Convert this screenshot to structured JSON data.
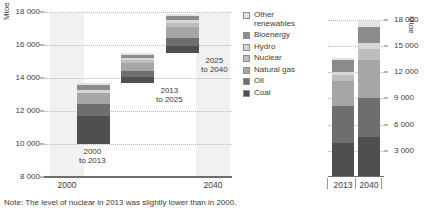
{
  "note": "Note: The level of nuclear in 2013 was slightly lower than in 2000.",
  "legend": {
    "items": [
      {
        "label": "Other renewables",
        "color": "#e3e3e3"
      },
      {
        "label": "Bioenergy",
        "color": "#8c8c8c"
      },
      {
        "label": "Hydro",
        "color": "#d6d6d6"
      },
      {
        "label": "Nuclear",
        "color": "#bdbdbd"
      },
      {
        "label": "Natural gas",
        "color": "#a6a6a6"
      },
      {
        "label": "Oil",
        "color": "#6e6e6e"
      },
      {
        "label": "Coal",
        "color": "#4f4f4f"
      }
    ]
  },
  "left": {
    "axis_title": "Mtoe",
    "yticks": [
      "8 000",
      "10 000",
      "12 000",
      "14 000",
      "16 000",
      "18 000"
    ],
    "xticks": [
      "2000",
      "2040"
    ],
    "bar_labels": [
      "2000 to 2013",
      "2013 to 2025",
      "2025 to 2040"
    ],
    "bar_label_lines": [
      [
        "2000",
        "to 2013"
      ],
      [
        "2013",
        "to 2025"
      ],
      [
        "2025",
        "to 2040"
      ]
    ]
  },
  "right": {
    "axis_title": "Mtoe",
    "yticks": [
      "3 000",
      "6 000",
      "9 000",
      "12 000",
      "15 000",
      "18 000"
    ],
    "xticks": [
      "2013",
      "2040"
    ]
  },
  "chart_data": {
    "type": "bar",
    "title": "",
    "charts": [
      {
        "name": "waterfall-primary-energy-demand-growth",
        "type": "bar",
        "subtype": "waterfall",
        "ylabel": "Mtoe",
        "xlabel": "",
        "ylim": [
          8000,
          18000
        ],
        "ytick_step": 2000,
        "yticks": [
          8000,
          10000,
          12000,
          14000,
          16000,
          18000
        ],
        "xticks": [
          2000,
          2040
        ],
        "grid": true,
        "legend_position": "right",
        "series_order": [
          "Coal",
          "Oil",
          "Natural gas",
          "Nuclear",
          "Hydro",
          "Bioenergy",
          "Other renewables"
        ],
        "steps": [
          {
            "label": "2000 to 2013",
            "base": 10000,
            "top": 13700,
            "total_increment": 3700,
            "segments": [
              {
                "name": "Coal",
                "value": 1700
              },
              {
                "name": "Oil",
                "value": 700
              },
              {
                "name": "Natural gas",
                "value": 700
              },
              {
                "name": "Nuclear",
                "value": 0
              },
              {
                "name": "Hydro",
                "value": 150
              },
              {
                "name": "Bioenergy",
                "value": 300
              },
              {
                "name": "Other renewables",
                "value": 150
              }
            ]
          },
          {
            "label": "2013 to 2025",
            "base": 13700,
            "top": 15500,
            "total_increment": 1800,
            "segments": [
              {
                "name": "Coal",
                "value": 350
              },
              {
                "name": "Oil",
                "value": 350
              },
              {
                "name": "Natural gas",
                "value": 500
              },
              {
                "name": "Nuclear",
                "value": 180
              },
              {
                "name": "Hydro",
                "value": 120
              },
              {
                "name": "Bioenergy",
                "value": 180
              },
              {
                "name": "Other renewables",
                "value": 120
              }
            ]
          },
          {
            "label": "2025 to 2040",
            "base": 15500,
            "top": 17900,
            "total_increment": 2400,
            "segments": [
              {
                "name": "Coal",
                "value": 450
              },
              {
                "name": "Oil",
                "value": 450
              },
              {
                "name": "Natural gas",
                "value": 700
              },
              {
                "name": "Nuclear",
                "value": 250
              },
              {
                "name": "Hydro",
                "value": 150
              },
              {
                "name": "Bioenergy",
                "value": 250
              },
              {
                "name": "Other renewables",
                "value": 150
              }
            ]
          }
        ]
      },
      {
        "name": "total-primary-energy-demand",
        "type": "bar",
        "subtype": "stacked",
        "ylabel": "Mtoe",
        "xlabel": "",
        "ylim": [
          0,
          18900
        ],
        "ytick_step": 3000,
        "yticks": [
          3000,
          6000,
          9000,
          12000,
          15000,
          18000
        ],
        "categories": [
          "2013",
          "2040"
        ],
        "grid": true,
        "series": [
          {
            "name": "Coal",
            "values": [
              3900,
              4550
            ]
          },
          {
            "name": "Oil",
            "values": [
              4250,
              4500
            ]
          },
          {
            "name": "Natural gas",
            "values": [
              2900,
              4400
            ]
          },
          {
            "name": "Nuclear",
            "values": [
              650,
              1250
            ]
          },
          {
            "name": "Hydro",
            "values": [
              330,
              600
            ]
          },
          {
            "name": "Bioenergy",
            "values": [
              1350,
              1900
            ]
          },
          {
            "name": "Other renewables",
            "values": [
              220,
              700
            ]
          }
        ],
        "totals": [
          13600,
          17900
        ]
      }
    ]
  }
}
